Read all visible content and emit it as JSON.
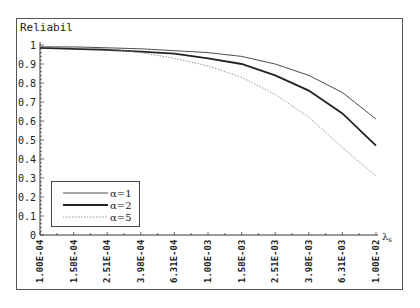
{
  "chart_data": {
    "type": "line",
    "title": "Reliabil",
    "ylabel": "Reliabil",
    "xlabel": "λs",
    "x_scale": "log",
    "ylim": [
      0,
      1
    ],
    "yticks": [
      "0",
      "0.1",
      "0.2",
      "0.3",
      "0.4",
      "0.5",
      "0.6",
      "0.7",
      "0.8",
      "0.9",
      "1"
    ],
    "categories": [
      "1.00E-04",
      "1.58E-04",
      "2.51E-04",
      "3.98E-04",
      "6.31E-04",
      "1.00E-03",
      "1.58E-03",
      "2.51E-03",
      "3.98E-03",
      "6.31E-03",
      "1.00E-02"
    ],
    "series": [
      {
        "name": "α=1",
        "style": "thin solid",
        "color": "#333333",
        "values": [
          0.99,
          0.99,
          0.985,
          0.98,
          0.97,
          0.96,
          0.94,
          0.9,
          0.84,
          0.75,
          0.61
        ]
      },
      {
        "name": "α=2",
        "style": "thick solid",
        "color": "#222222",
        "values": [
          0.985,
          0.98,
          0.975,
          0.965,
          0.955,
          0.93,
          0.9,
          0.84,
          0.76,
          0.64,
          0.47
        ]
      },
      {
        "name": "α=5",
        "style": "dotted",
        "color": "#888888",
        "values": [
          0.99,
          0.985,
          0.98,
          0.96,
          0.93,
          0.89,
          0.83,
          0.74,
          0.62,
          0.46,
          0.31
        ]
      }
    ],
    "legend_position": "lower-left",
    "grid": false
  },
  "legend": [
    {
      "label": "α=1"
    },
    {
      "label": "α=2"
    },
    {
      "label": "α=5"
    }
  ],
  "axis": {
    "x_unit_label": "λ",
    "x_unit_sub": "s"
  }
}
